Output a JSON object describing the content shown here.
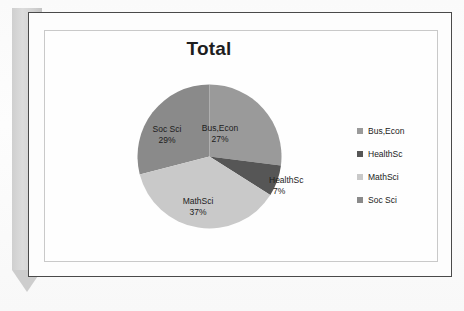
{
  "slide": {
    "title": "Total"
  },
  "chart_data": {
    "type": "pie",
    "title": "Total",
    "categories": [
      "Bus,Econ",
      "HealthSc",
      "MathSci",
      "Soc Sci"
    ],
    "values": [
      27,
      7,
      37,
      29
    ],
    "value_labels": [
      "27%",
      "7%",
      "37%",
      "29%"
    ],
    "unit": "percent",
    "legend_position": "right",
    "grid": false,
    "colors": [
      "#9a9a9a",
      "#565656",
      "#c9c9c9",
      "#8a8a8a"
    ],
    "slices": [
      {
        "label": "Bus,Econ",
        "percent": "27%",
        "value": 27,
        "color": "#9a9a9a",
        "label_placement": "inside"
      },
      {
        "label": "HealthSc",
        "percent": "7%",
        "value": 7,
        "color": "#565656",
        "label_placement": "outside"
      },
      {
        "label": "MathSci",
        "percent": "37%",
        "value": 37,
        "color": "#c9c9c9",
        "label_placement": "inside"
      },
      {
        "label": "Soc Sci",
        "percent": "29%",
        "value": 29,
        "color": "#8a8a8a",
        "label_placement": "inside"
      }
    ]
  },
  "legend": {
    "items": [
      {
        "label": "Bus,Econ",
        "color": "#9a9a9a"
      },
      {
        "label": "HealthSc",
        "color": "#565656"
      },
      {
        "label": "MathSci",
        "color": "#c9c9c9"
      },
      {
        "label": "Soc Sci",
        "color": "#8a8a8a"
      }
    ]
  }
}
